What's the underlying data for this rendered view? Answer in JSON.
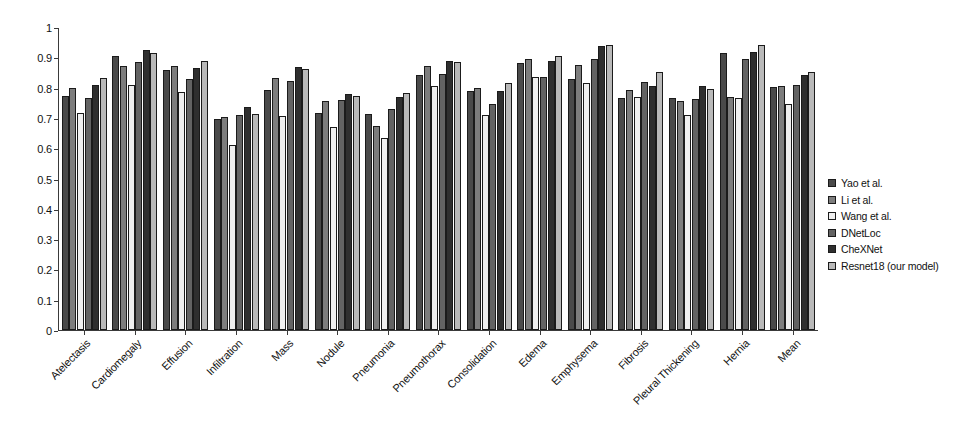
{
  "chart_data": {
    "type": "bar",
    "title": "",
    "xlabel": "",
    "ylabel": "",
    "ylim": [
      0,
      1
    ],
    "ytick_values": [
      "0",
      "0.1",
      "0.2",
      "0.3",
      "0.4",
      "0.5",
      "0.6",
      "0.7",
      "0.8",
      "0.9",
      "1"
    ],
    "grid": false,
    "legend_position": "right",
    "categories": [
      "Atelectasis",
      "Cardiomegaly",
      "Effusion",
      "Infiltration",
      "Mass",
      "Nodule",
      "Pneumonia",
      "Pneumothorax",
      "Consolidation",
      "Edema",
      "Emphysema",
      "Fibrosis",
      "Pleural Thickening",
      "Hernia",
      "Mean"
    ],
    "series": [
      {
        "name": "Yao et al.",
        "color": "#4a4a4a",
        "values": [
          0.772,
          0.904,
          0.859,
          0.695,
          0.792,
          0.717,
          0.713,
          0.841,
          0.788,
          0.882,
          0.829,
          0.767,
          0.765,
          0.914,
          0.803
        ]
      },
      {
        "name": "Li et al.",
        "color": "#7d7d7d",
        "values": [
          0.8,
          0.87,
          0.87,
          0.702,
          0.833,
          0.756,
          0.673,
          0.872,
          0.8,
          0.893,
          0.875,
          0.791,
          0.757,
          0.77,
          0.806
        ]
      },
      {
        "name": "Wang et al.",
        "color": "#efefef",
        "values": [
          0.716,
          0.807,
          0.784,
          0.609,
          0.706,
          0.671,
          0.633,
          0.806,
          0.708,
          0.835,
          0.815,
          0.769,
          0.708,
          0.767,
          0.745
        ]
      },
      {
        "name": "DNetLoc",
        "color": "#636363",
        "values": [
          0.767,
          0.883,
          0.828,
          0.709,
          0.821,
          0.758,
          0.731,
          0.846,
          0.745,
          0.835,
          0.895,
          0.818,
          0.761,
          0.896,
          0.807
        ]
      },
      {
        "name": "CheXNet",
        "color": "#2f2f2f",
        "values": [
          0.809,
          0.925,
          0.864,
          0.735,
          0.868,
          0.78,
          0.768,
          0.889,
          0.79,
          0.888,
          0.937,
          0.805,
          0.806,
          0.916,
          0.841
        ]
      },
      {
        "name": "Resnet18 (our model)",
        "color": "#b9b9b9",
        "values": [
          0.833,
          0.915,
          0.888,
          0.712,
          0.863,
          0.773,
          0.782,
          0.885,
          0.815,
          0.904,
          0.942,
          0.851,
          0.795,
          0.942,
          0.852
        ]
      }
    ]
  },
  "legend": {
    "items": [
      {
        "label": "Yao et al."
      },
      {
        "label": "Li et al."
      },
      {
        "label": "Wang et al."
      },
      {
        "label": "DNetLoc"
      },
      {
        "label": "CheXNet"
      },
      {
        "label": "Resnet18 (our model)"
      }
    ]
  }
}
